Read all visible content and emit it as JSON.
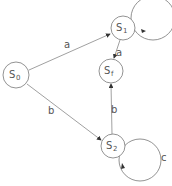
{
  "diagram": {
    "type": "finite-state-automaton",
    "states": [
      {
        "id": "S0",
        "base": "S",
        "sub": "0",
        "x": 16,
        "y": 75,
        "r": 13
      },
      {
        "id": "S1",
        "base": "S",
        "sub": "1",
        "x": 123,
        "y": 28,
        "r": 12
      },
      {
        "id": "Sf",
        "base": "S",
        "sub": "f",
        "x": 111,
        "y": 71,
        "r": 12
      },
      {
        "id": "S2",
        "base": "S",
        "sub": "2",
        "x": 113,
        "y": 146,
        "r": 12
      }
    ],
    "transitions": [
      {
        "from": "S0",
        "to": "S1",
        "label": "a"
      },
      {
        "from": "S0",
        "to": "S2",
        "label": "b"
      },
      {
        "from": "S1",
        "to": "Sf",
        "label": "a"
      },
      {
        "from": "S2",
        "to": "Sf",
        "label": "b"
      },
      {
        "from": "S1",
        "to": "S1",
        "label": ""
      },
      {
        "from": "S2",
        "to": "S2",
        "label": "c"
      }
    ],
    "colors": {
      "stroke": "#777777",
      "text": "#555555"
    }
  }
}
